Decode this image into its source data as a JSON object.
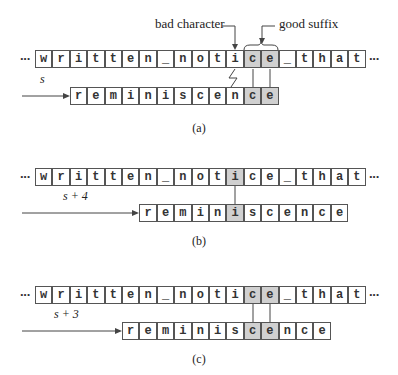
{
  "text": "written_notice_that",
  "pattern": "reminiscence",
  "panels": [
    {
      "caption": "(a)",
      "shift_label": "s",
      "pattern_offset": 2,
      "text_highlight": [
        12,
        13
      ],
      "pattern_highlight": [
        10,
        11
      ],
      "annotations": {
        "bad_character": "bad character",
        "good_suffix": "good suffix"
      }
    },
    {
      "caption": "(b)",
      "shift_label": "s + 4",
      "pattern_offset": 6,
      "text_highlight": [
        11
      ],
      "pattern_highlight": [
        5
      ]
    },
    {
      "caption": "(c)",
      "shift_label": "s + 3",
      "pattern_offset": 5,
      "text_highlight": [
        12,
        13
      ],
      "pattern_highlight": [
        7,
        8
      ]
    }
  ],
  "ellipsis": "···",
  "colors": {
    "highlight": "#d0d0d0",
    "border": "#555555"
  }
}
